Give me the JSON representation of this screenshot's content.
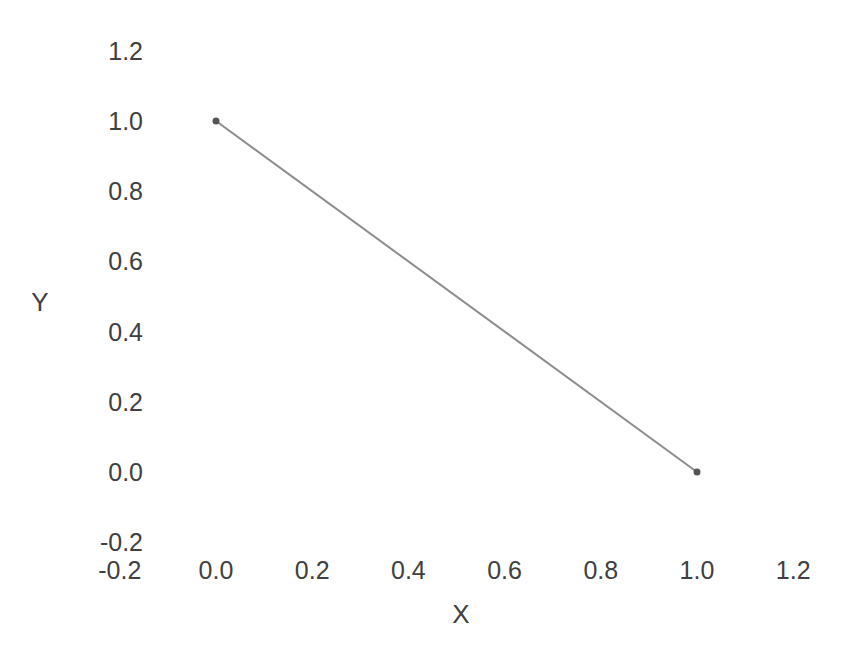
{
  "chart_data": {
    "type": "line",
    "title": "",
    "xlabel": "X",
    "ylabel": "Y",
    "xlim": [
      -0.3,
      1.3
    ],
    "ylim": [
      -0.3,
      1.3
    ],
    "xticks": [
      "-0.2",
      "0.0",
      "0.2",
      "0.4",
      "0.6",
      "0.8",
      "1.0",
      "1.2"
    ],
    "xtick_values": [
      -0.2,
      0.0,
      0.2,
      0.4,
      0.6,
      0.8,
      1.0,
      1.2
    ],
    "yticks": [
      "-0.2",
      "0.0",
      "0.2",
      "0.4",
      "0.6",
      "0.8",
      "1.0",
      "1.2"
    ],
    "ytick_values": [
      -0.2,
      0.0,
      0.2,
      0.4,
      0.6,
      0.8,
      1.0,
      1.2
    ],
    "grid": false,
    "spines": false,
    "legend": null,
    "series": [
      {
        "name": "series-1",
        "x": [
          0.0,
          1.0
        ],
        "y": [
          1.0,
          0.0
        ],
        "line_color": "#8c8c8c",
        "line_width": 2,
        "marker": "circle",
        "marker_color": "#555555",
        "marker_size": 7
      }
    ],
    "annotations": [
      {
        "name": "clipped-top-label",
        "text": "1.4",
        "note": "partially cut off at top edge of figure"
      }
    ]
  },
  "style": {
    "background": "#ffffff",
    "text_color": "#404040",
    "line_color": "#8c8c8c",
    "marker_color": "#555555"
  },
  "geometry": {
    "x_pixel_at_0": 216,
    "x_pixel_at_1": 697,
    "y_pixel_at_0": 472,
    "y_pixel_at_1": 121,
    "ytick_right_edge": 143,
    "xtick_baseline_y": 558,
    "ylabel_pos": [
      40,
      302
    ],
    "xlabel_pos": [
      461,
      614
    ]
  }
}
